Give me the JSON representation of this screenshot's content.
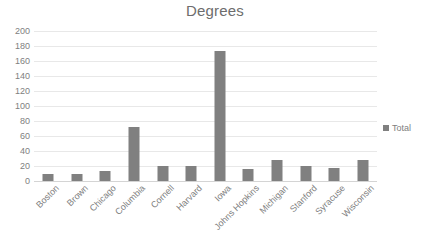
{
  "chart_data": {
    "type": "bar",
    "title": "Degrees",
    "xlabel": "",
    "ylabel": "",
    "ylim": [
      0,
      200
    ],
    "ytick_step": 20,
    "yticks": [
      200,
      180,
      160,
      140,
      120,
      100,
      80,
      60,
      40,
      20,
      0
    ],
    "grid": true,
    "legend_position": "right",
    "categories": [
      "Boston",
      "Brown",
      "Chicago",
      "Columbia",
      "Cornell",
      "Harvard",
      "Iowa",
      "Johns Hopkins",
      "Michigan",
      "Stanford",
      "Syracuse",
      "Wisconsin"
    ],
    "series": [
      {
        "name": "Total",
        "color": "#808080",
        "values": [
          9,
          10,
          14,
          72,
          20,
          20,
          173,
          16,
          28,
          20,
          18,
          28
        ]
      }
    ]
  },
  "legend": {
    "entries": [
      {
        "label": "Total",
        "color": "#808080"
      }
    ]
  },
  "colors": {
    "bar": "#808080",
    "gridline": "#e8e8e8",
    "axis": "#d4d4d4",
    "text": "#808080",
    "title": "#6d6d6d",
    "background": "#ffffff"
  }
}
